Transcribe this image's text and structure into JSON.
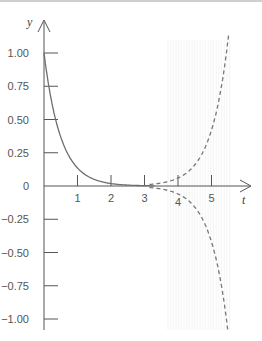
{
  "chart_data": {
    "type": "line",
    "title": "",
    "xlabel": "t",
    "ylabel": "y",
    "xlim": [
      0,
      6
    ],
    "ylim": [
      -1.1,
      1.15
    ],
    "grid": false,
    "legend": null,
    "x_ticks": [
      "1",
      "2",
      "3",
      "4",
      "5"
    ],
    "y_ticks": [
      "1.00",
      "0.75",
      "0.50",
      "0.25",
      "0",
      "−0.25",
      "−0.50",
      "−0.75",
      "−1.00"
    ],
    "series": [
      {
        "name": "solution",
        "style": "solid",
        "x": [
          0,
          0.15,
          0.36,
          0.5,
          0.69,
          1.0,
          1.5,
          2.0,
          2.5,
          3.0
        ],
        "values": [
          1.0,
          0.75,
          0.5,
          0.37,
          0.25,
          0.16,
          0.08,
          0.04,
          0.02,
          0.01
        ]
      },
      {
        "name": "upper divergent (dashed)",
        "style": "dashed",
        "x": [
          3.2,
          3.5,
          4.0,
          4.5,
          5.0,
          5.25,
          5.5
        ],
        "values": [
          0.013,
          0.023,
          0.06,
          0.16,
          0.42,
          0.68,
          1.1
        ]
      },
      {
        "name": "lower divergent (dashed)",
        "style": "dashed",
        "x": [
          3.2,
          3.5,
          4.0,
          4.5,
          5.0,
          5.25,
          5.46
        ],
        "values": [
          -0.013,
          -0.023,
          -0.06,
          -0.16,
          -0.42,
          -0.68,
          -1.07
        ]
      }
    ],
    "annotations": [
      "faint vertical hatching shading for t ≈ 3.7 to 5.6"
    ]
  },
  "axes": {
    "x_label": "t",
    "y_label": "y"
  },
  "colors": {
    "axis": "#555555",
    "curve": "#6e6e6e",
    "dashed": "#777777",
    "hatch": "#ececec"
  }
}
